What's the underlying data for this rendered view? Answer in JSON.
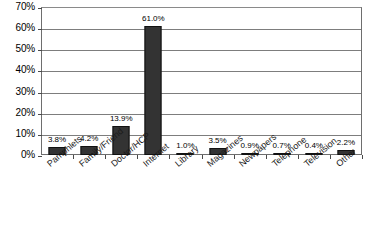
{
  "chart_data": {
    "type": "bar",
    "title": "",
    "subtitle": "",
    "xlabel": "",
    "ylabel": "",
    "categories": [
      "Pamphlets",
      "Family/Friend",
      "Doctor/HCP",
      "Internet",
      "Library",
      "Magazines",
      "Newpapers",
      "Telephone",
      "Television",
      "Other"
    ],
    "values": [
      3.8,
      4.2,
      13.9,
      61.0,
      1.0,
      3.5,
      0.9,
      0.7,
      0.4,
      2.2
    ],
    "data_labels": [
      "3.8%",
      "4.2%",
      "13.9%",
      "61.0%",
      "1.0%",
      "3.5%",
      "0.9%",
      "0.7%",
      "0.4%",
      "2.2%"
    ],
    "ylim": [
      0,
      70
    ],
    "ytick_values": [
      0,
      10,
      20,
      30,
      40,
      50,
      60,
      70
    ],
    "ytick_labels": [
      "0%",
      "10%",
      "20%",
      "30%",
      "40%",
      "50%",
      "60%",
      "70%"
    ],
    "grid": true,
    "grid_axis": "y",
    "legend": false,
    "legend_position": "none",
    "bar_color": "#333333",
    "grid_color": "#7d7d7d",
    "frame_color": "#6e6e6e",
    "background_color": "#ffffff",
    "label_rotation_degrees": -40
  }
}
